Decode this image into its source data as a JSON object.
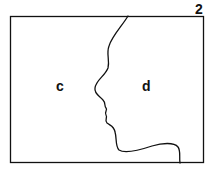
{
  "figure": {
    "number": "2",
    "region_left_label": "c",
    "region_right_label": "d",
    "line_color": "#111111",
    "background": "#ffffff"
  }
}
